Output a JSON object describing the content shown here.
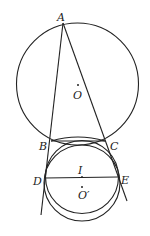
{
  "diagram": {
    "type": "geometry",
    "points": {
      "A": {
        "label": "A",
        "x": 63,
        "y": 23
      },
      "B": {
        "label": "B",
        "x": 51,
        "y": 141
      },
      "C": {
        "label": "C",
        "x": 105,
        "y": 141
      },
      "D": {
        "label": "D",
        "x": 45,
        "y": 178
      },
      "E": {
        "label": "E",
        "x": 118,
        "y": 177
      },
      "O": {
        "label": "O",
        "x": 78,
        "y": 85
      },
      "I": {
        "label": "I",
        "x": 82,
        "y": 177
      },
      "O_prime": {
        "label": "O′",
        "x": 82,
        "y": 187
      }
    },
    "circles": [
      {
        "name": "circumcircle",
        "center": "O",
        "cx": 77.5,
        "cy": 84,
        "r": 61
      },
      {
        "name": "inner-circle",
        "cx": 82,
        "cy": 177,
        "r": 36.5
      },
      {
        "name": "circle-O-prime",
        "cx": 82,
        "cy": 183,
        "r": 38
      }
    ],
    "segments": [
      {
        "name": "line-AB-extended",
        "x1": 63,
        "y1": 23,
        "x2": 41,
        "y2": 215
      },
      {
        "name": "line-AC-extended",
        "x1": 63,
        "y1": 23,
        "x2": 127,
        "y2": 201
      },
      {
        "name": "segment-BC",
        "x1": 51,
        "y1": 141,
        "x2": 105,
        "y2": 141
      },
      {
        "name": "segment-DE",
        "x1": 45,
        "y1": 178,
        "x2": 118,
        "y2": 177
      }
    ]
  }
}
